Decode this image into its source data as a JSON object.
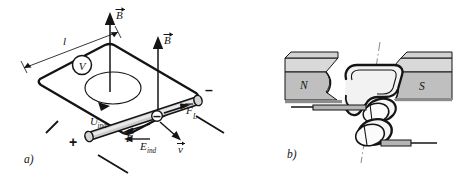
{
  "figure": {
    "background_color": "#ffffff",
    "ink_color": "#141414",
    "panels": [
      {
        "tag": "a)",
        "name": "moving-rod-induction",
        "description": "Conducting rod sliding on rails in a magnetic field with voltmeter"
      },
      {
        "tag": "b)",
        "name": "rotating-coil-generator",
        "description": "Coil rotating between magnet poles with slip rings and brushes"
      }
    ]
  },
  "panel_a": {
    "tag": "a)",
    "labels": {
      "length": "l",
      "field_1": "B",
      "field_2": "B",
      "voltmeter": "V",
      "induced_voltage": "U",
      "induced_voltage_sub": "ind",
      "induced_field": "E",
      "induced_field_sub": "ind",
      "force": "F",
      "lorentz_force": "F",
      "lorentz_force_sub": "L",
      "velocity": "v",
      "terminal_positive": "+",
      "terminal_negative": "–",
      "electron_charge": "–"
    },
    "vector_labels": [
      "B",
      "B",
      "E",
      "F",
      "F_L",
      "v"
    ],
    "colors": {
      "rod_fill": "#cfcfcf",
      "rod_highlight": "#e8e8e8",
      "outline": "#141414"
    }
  },
  "panel_b": {
    "tag": "b)",
    "labels": {
      "north_pole": "N",
      "south_pole": "S"
    },
    "colors": {
      "magnet_top_face": "#d8d8d8",
      "magnet_front_face": "#bfbfbf",
      "coil_fill": "#f2f2f2",
      "ring_fill": "#f5f5f5",
      "brush_fill": "#b5b5b5",
      "outline": "#141414",
      "axis_line": "#8a8a8a"
    }
  }
}
